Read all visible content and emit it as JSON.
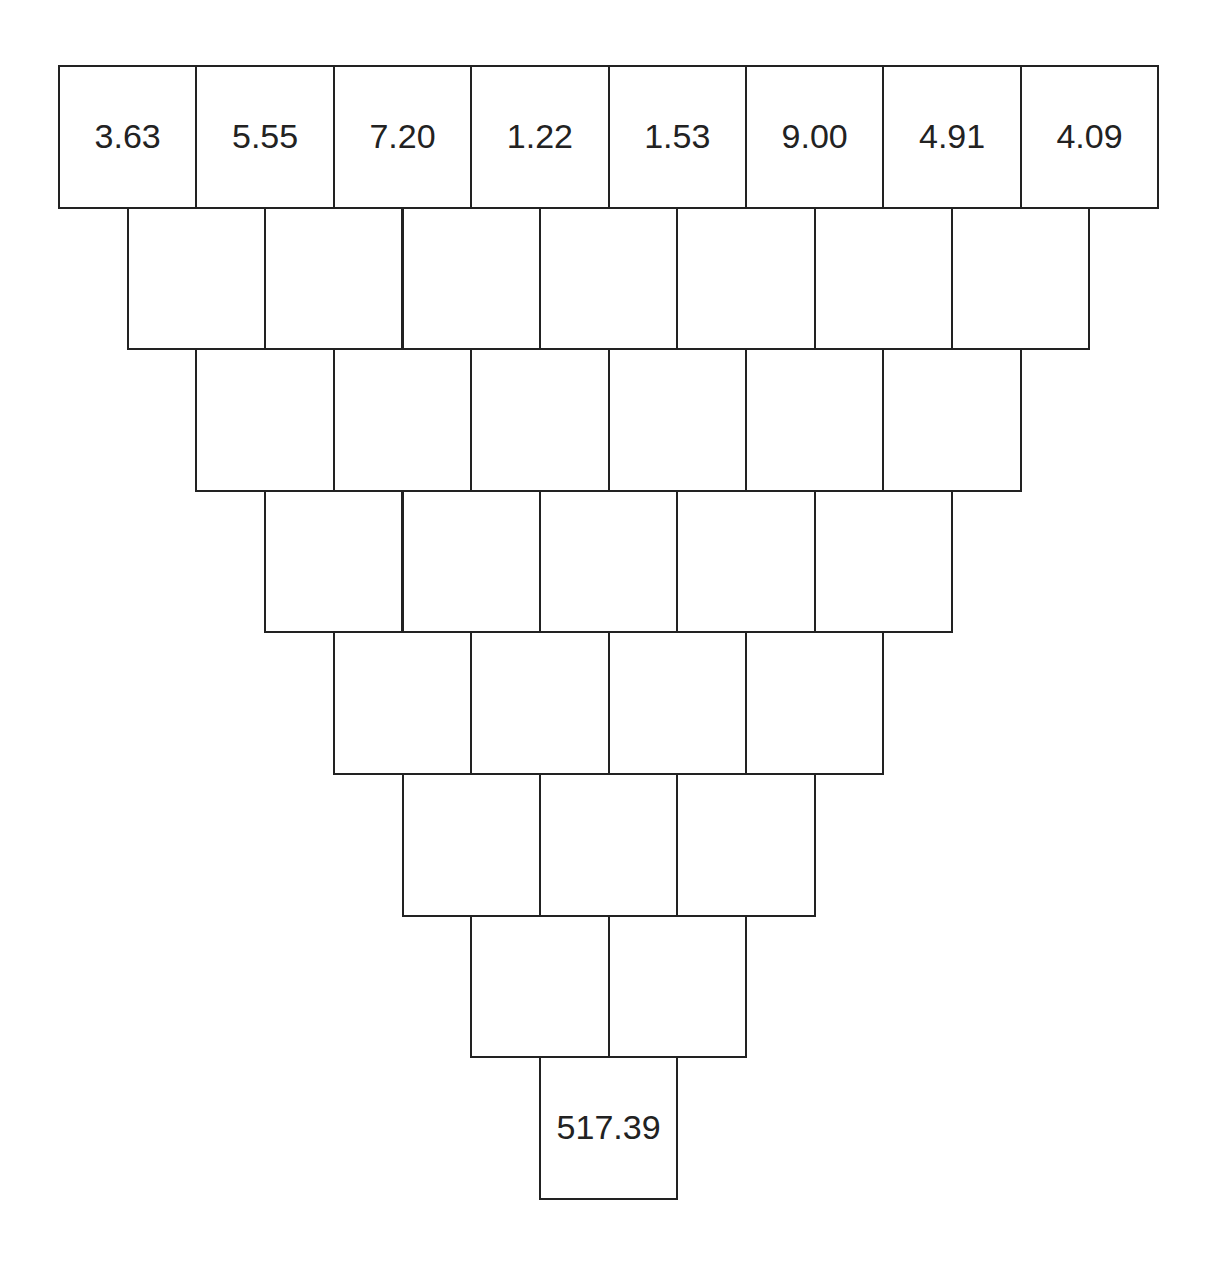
{
  "diagram": {
    "type": "inverted-pyramid",
    "rows": [
      [
        "3.63",
        "5.55",
        "7.20",
        "1.22",
        "1.53",
        "9.00",
        "4.91",
        "4.09"
      ],
      [
        "",
        "",
        "",
        "",
        "",
        "",
        ""
      ],
      [
        "",
        "",
        "",
        "",
        "",
        ""
      ],
      [
        "",
        "",
        "",
        "",
        ""
      ],
      [
        "",
        "",
        "",
        ""
      ],
      [
        "",
        "",
        ""
      ],
      [
        "",
        ""
      ],
      [
        "517.39"
      ]
    ]
  }
}
